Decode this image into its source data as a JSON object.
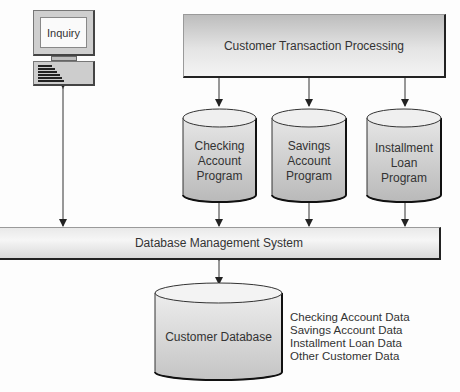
{
  "diagram": {
    "terminal": {
      "label": "Inquiry",
      "icon": "computer-terminal-icon"
    },
    "transaction_processor": {
      "label": "Customer Transaction Processing"
    },
    "programs": [
      {
        "label": "Checking\nAccount\nProgram"
      },
      {
        "label": "Savings\nAccount\nProgram"
      },
      {
        "label": "Installment\nLoan\nProgram"
      }
    ],
    "dbms": {
      "label": "Database Management System"
    },
    "database": {
      "label": "Customer Database",
      "contents": [
        "Checking Account Data",
        "Savings Account Data",
        "Installment Loan Data",
        "Other Customer Data"
      ]
    },
    "colors": {
      "line": "#333333",
      "box_gradient_top": "#bdbdbd",
      "box_gradient_bottom": "#f4f4f4",
      "shadow_edge": "#222222"
    }
  }
}
